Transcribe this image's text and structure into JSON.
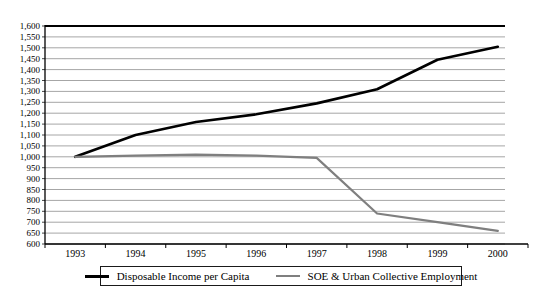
{
  "chart_data": {
    "type": "line",
    "title": "",
    "categories": [
      "1993",
      "1994",
      "1995",
      "1996",
      "1997",
      "1998",
      "1999",
      "2000"
    ],
    "series": [
      {
        "name": "Disposable Income per Capita",
        "color": "#000000",
        "line_width": 2.6,
        "values": [
          1000,
          1100,
          1160,
          1195,
          1245,
          1310,
          1445,
          1505
        ]
      },
      {
        "name": "SOE & Urban Collective Employment",
        "color": "#7f7f7f",
        "line_width": 2.2,
        "values": [
          1000,
          1005,
          1010,
          1005,
          995,
          740,
          700,
          660
        ]
      }
    ],
    "ylim": [
      600,
      1600
    ],
    "y_step": 50,
    "y_tick_labels": [
      "1,600",
      "1,550",
      "1,500",
      "1,450",
      "1,400",
      "1,350",
      "1,300",
      "1,250",
      "1,200",
      "1,150",
      "1,100",
      "1,050",
      "1,000",
      "950",
      "900",
      "850",
      "800",
      "750",
      "700",
      "650",
      "600"
    ],
    "xlabel": "",
    "ylabel": "",
    "grid": true,
    "legend_position": "bottom",
    "axis_color": "#000000",
    "gridline_color": "#a6a6a6",
    "tick_color": "#444444"
  }
}
